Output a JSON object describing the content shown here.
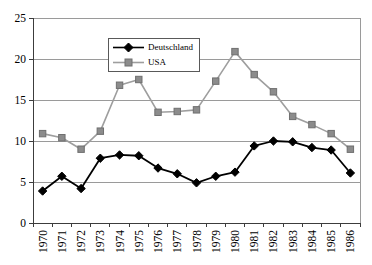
{
  "chart_data": {
    "type": "line",
    "title": "",
    "xlabel": "",
    "ylabel": "",
    "categories": [
      "1970",
      "1971",
      "1972",
      "1973",
      "1974",
      "1975",
      "1976",
      "1977",
      "1978",
      "1979",
      "1980",
      "1981",
      "1982",
      "1983",
      "1984",
      "1985",
      "1986"
    ],
    "series": [
      {
        "name": "Deutschland",
        "marker": "diamond",
        "line_color": "#000000",
        "marker_fill": "#000000",
        "marker_stroke": "#000000",
        "values": [
          3.9,
          5.7,
          4.2,
          7.9,
          8.3,
          8.2,
          6.7,
          6.0,
          4.9,
          5.7,
          6.2,
          9.4,
          10.0,
          9.9,
          9.2,
          8.9,
          6.1
        ]
      },
      {
        "name": "USA",
        "marker": "square",
        "line_color": "#9e9e9e",
        "marker_fill": "#8c8c8c",
        "marker_stroke": "#6f6f6f",
        "values": [
          10.9,
          10.4,
          9.0,
          11.2,
          16.8,
          17.5,
          13.5,
          13.6,
          13.8,
          17.3,
          20.9,
          18.1,
          16.0,
          13.0,
          12.0,
          10.9,
          9.0
        ]
      }
    ],
    "ylim": [
      0,
      25
    ],
    "yticks": [
      0,
      5,
      10,
      15,
      20,
      25
    ],
    "grid": "horizontal",
    "legend_position": "top-center-inside",
    "x_labels_rotated_degrees": -90
  },
  "colors": {
    "background": "#ffffff",
    "axis": "#3c3c3c",
    "gridline": "#9a9a9a",
    "frame": "#9a9a9a",
    "tick_label": "#000000",
    "legend_border": "#595959"
  }
}
